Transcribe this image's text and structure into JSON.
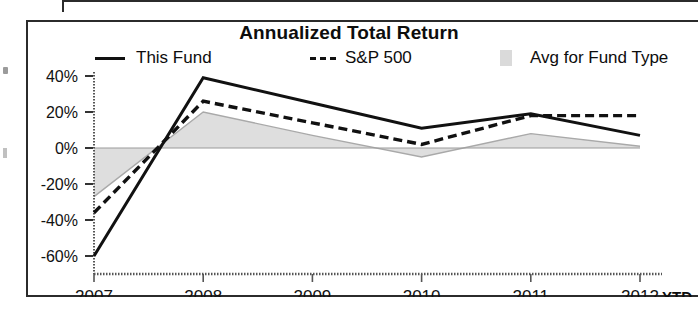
{
  "chart_data": {
    "type": "line",
    "title": "Annualized Total Return",
    "xlabel": "",
    "ylabel": "",
    "x": [
      "2007",
      "2008",
      "2009",
      "2010",
      "2011",
      "2012"
    ],
    "categories": [
      "2007",
      "2008",
      "2009",
      "2010",
      "2011",
      "2012"
    ],
    "x_axis_suffix": "YTD",
    "ytick_labels": [
      "40%",
      "20%",
      "0%",
      "-20%",
      "-40%",
      "-60%"
    ],
    "ytick_values": [
      40,
      20,
      0,
      -20,
      -40,
      -60
    ],
    "ylim": [
      -68,
      46
    ],
    "grid": false,
    "legend_position": "top",
    "series": [
      {
        "name": "This Fund",
        "style": "solid-line",
        "color": "#111111",
        "values": [
          -60,
          39,
          25,
          11,
          19,
          7
        ]
      },
      {
        "name": "S&P 500",
        "style": "dashed-line",
        "color": "#111111",
        "values": [
          -36,
          26,
          14,
          2,
          18,
          18
        ]
      },
      {
        "name": "Avg for Fund Type",
        "style": "shaded-area",
        "color": "#d3d3d3",
        "values": [
          -27,
          20,
          7,
          -5,
          8,
          1
        ]
      }
    ]
  },
  "chart": {
    "title": "Annualized Total Return",
    "legend": [
      {
        "label": "This Fund",
        "marker": "solid-line-swatch"
      },
      {
        "label": "S&P 500",
        "marker": "dashed-line-swatch"
      },
      {
        "label": "Avg for Fund Type",
        "marker": "gray-fill-swatch"
      }
    ],
    "x_axis": {
      "ticks": [
        "2007",
        "2008",
        "2009",
        "2010",
        "2011",
        "2012"
      ],
      "suffix": "YTD"
    },
    "y_axis": {
      "ticks": [
        "40%",
        "20%",
        "0%",
        "-20%",
        "-40%",
        "-60%"
      ]
    }
  },
  "colors": {
    "line": "#111111",
    "area": "#d3d3d3",
    "frame": "#2b2b2b",
    "text": "#0d0d0d"
  }
}
